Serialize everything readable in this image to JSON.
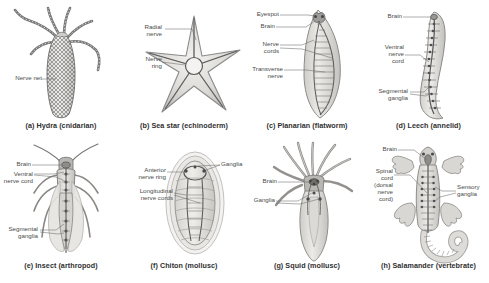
{
  "figure": {
    "background_color": "#ffffff",
    "ink_color": "#4a4a4a",
    "panel_count": 8
  },
  "panels": [
    {
      "id": "hydra",
      "letter": "(a)",
      "caption": "(a) Hydra (cnidarian)",
      "organism": "Hydra",
      "group": "cnidarian",
      "nervous_system_type": "nerve net",
      "labels": [
        {
          "name": "nerve-net",
          "text": "Nerve net"
        }
      ]
    },
    {
      "id": "sea-star",
      "letter": "(b)",
      "caption": "(b) Sea star (echinoderm)",
      "organism": "Sea star",
      "group": "echinoderm",
      "nervous_system_type": "radial nerves with nerve ring",
      "labels": [
        {
          "name": "radial-nerve",
          "text": "Radial\nnerve"
        },
        {
          "name": "nerve-ring",
          "text": "Nerve\nring"
        }
      ]
    },
    {
      "id": "planarian",
      "letter": "(c)",
      "caption": "(c) Planarian (flatworm)",
      "organism": "Planarian",
      "group": "flatworm",
      "nervous_system_type": "ladder-like nerve cords",
      "labels": [
        {
          "name": "eyespot",
          "text": "Eyespot"
        },
        {
          "name": "brain",
          "text": "Brain"
        },
        {
          "name": "nerve-cords",
          "text": "Nerve\ncords"
        },
        {
          "name": "transverse-nerve",
          "text": "Transverse\nnerve"
        }
      ]
    },
    {
      "id": "leech",
      "letter": "(d)",
      "caption": "(d) Leech (annelid)",
      "organism": "Leech",
      "group": "annelid",
      "nervous_system_type": "ventral nerve cord with segmental ganglia",
      "labels": [
        {
          "name": "brain",
          "text": "Brain"
        },
        {
          "name": "ventral-nerve-cord",
          "text": "Ventral\nnerve\ncord"
        },
        {
          "name": "segmental-ganglia",
          "text": "Segmental\nganglia"
        }
      ]
    },
    {
      "id": "insect",
      "letter": "(e)",
      "caption": "(e) Insect (arthropod)",
      "organism": "Insect",
      "group": "arthropod",
      "nervous_system_type": "ventral nerve cord with segmental ganglia",
      "labels": [
        {
          "name": "brain",
          "text": "Brain"
        },
        {
          "name": "ventral-nerve-cord",
          "text": "Ventral\nnerve cord"
        },
        {
          "name": "segmental-ganglia",
          "text": "Segmental\nganglia"
        }
      ]
    },
    {
      "id": "chiton",
      "letter": "(f)",
      "caption": "(f) Chiton (mollusc)",
      "organism": "Chiton",
      "group": "mollusc",
      "nervous_system_type": "anterior nerve ring with longitudinal nerve cords",
      "labels": [
        {
          "name": "anterior-nerve-ring",
          "text": "Anterior\nnerve ring"
        },
        {
          "name": "longitudinal-nerve-cords",
          "text": "Longitudinal\nnerve cords"
        },
        {
          "name": "ganglia",
          "text": "Ganglia"
        }
      ]
    },
    {
      "id": "squid",
      "letter": "(g)",
      "caption": "(g) Squid (mollusc)",
      "organism": "Squid",
      "group": "mollusc",
      "nervous_system_type": "brain with ganglia",
      "labels": [
        {
          "name": "brain",
          "text": "Brain"
        },
        {
          "name": "ganglia",
          "text": "Ganglia"
        }
      ]
    },
    {
      "id": "salamander",
      "letter": "(h)",
      "caption": "(h) Salamander (vertebrate)",
      "organism": "Salamander",
      "group": "vertebrate",
      "nervous_system_type": "brain and dorsal spinal cord",
      "labels": [
        {
          "name": "brain",
          "text": "Brain"
        },
        {
          "name": "spinal-cord",
          "text": "Spinal\ncord\n(dorsal\nnerve\ncord)"
        },
        {
          "name": "sensory-ganglia",
          "text": "Sensory\nganglia"
        }
      ]
    }
  ]
}
